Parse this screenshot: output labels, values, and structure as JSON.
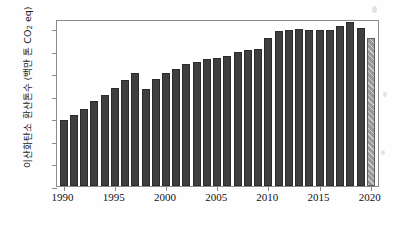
{
  "chart_data": {
    "type": "bar",
    "title": "",
    "subtitle": "",
    "xlabel": "",
    "ylabel": "이산화탄소 환산톤수 (백만 톤 CO2 eq)",
    "ylabel_parts": {
      "prefix": "이산화탄소 환산톤수 (백만 톤 CO",
      "subscript": "2",
      "suffix": " eq)"
    },
    "categories": [
      "1990",
      "1991",
      "1992",
      "1993",
      "1994",
      "1995",
      "1996",
      "1997",
      "1998",
      "1999",
      "2000",
      "2001",
      "2002",
      "2003",
      "2004",
      "2005",
      "2006",
      "2007",
      "2008",
      "2009",
      "2010",
      "2011",
      "2012",
      "2013",
      "2014",
      "2015",
      "2016",
      "2017",
      "2018",
      "2019",
      "2020"
    ],
    "values": [
      293,
      313,
      342,
      377,
      403,
      434,
      470,
      502,
      432,
      472,
      502,
      517,
      539,
      550,
      563,
      569,
      578,
      593,
      601,
      608,
      658,
      685,
      690,
      697,
      691,
      692,
      693,
      710,
      727,
      701,
      656
    ],
    "series": [
      {
        "name": "총 온실가스 배출량",
        "values": [
          293,
          313,
          342,
          377,
          403,
          434,
          470,
          502,
          432,
          472,
          502,
          517,
          539,
          550,
          563,
          569,
          578,
          593,
          601,
          608,
          658,
          685,
          690,
          697,
          691,
          692,
          693,
          710,
          727,
          701,
          656
        ]
      }
    ],
    "highlight": {
      "category": "2020",
      "style": "hatched",
      "note": "잠정치"
    },
    "ylim": [
      0,
      740
    ],
    "yticks": [
      0,
      100,
      200,
      300,
      400,
      500,
      600,
      700
    ],
    "ytick_labels": [
      "0",
      "100",
      "200",
      "300",
      "400",
      "500",
      "600",
      "700"
    ],
    "xticks": [
      "1990",
      "1995",
      "2000",
      "2005",
      "2010",
      "2015",
      "2020"
    ],
    "grid": false,
    "legend": "none",
    "colors": {
      "bar": "#3f3f3f",
      "bar_edge": "#2b2b2b",
      "bar_projected": "#9a9a9a",
      "bar_projected_edge": "#5e5e5e",
      "axis": "#8c8c8c",
      "text": "#111111",
      "background": "#ffffff"
    }
  }
}
